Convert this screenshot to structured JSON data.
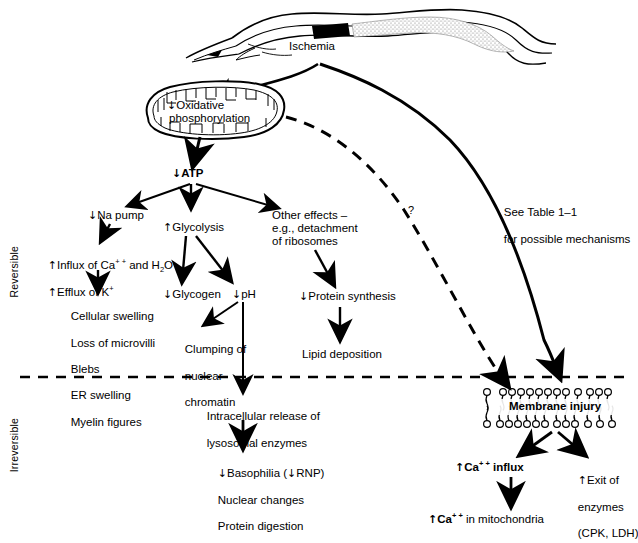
{
  "figure": {
    "zones": {
      "reversible": "Reversible",
      "irreversible": "Irreversible"
    },
    "divider": "dashed-reversibility-line"
  },
  "nodes": {
    "ischemia": {
      "label": "Ischemia"
    },
    "oxphos": {
      "arrow": "↓",
      "line1": "Oxidative",
      "line2": "phosphorylation"
    },
    "atp": {
      "arrow": "↓",
      "label": "ATP"
    },
    "na_pump": {
      "arrow": "↓",
      "label": "Na pump"
    },
    "glycolysis": {
      "arrow": "↑",
      "label": "Glycolysis"
    },
    "other_effects": {
      "line1": "Other effects –",
      "line2": "e.g., detachment",
      "line3": "of ribosomes"
    },
    "influx": {
      "line1_arrow": "↑",
      "line1_a": "Influx of Ca",
      "line1_sup": "+ +",
      "line1_b": " and H",
      "line1_sub": "2",
      "line1_c": "O",
      "line2_arrow": "↑",
      "line2_a": "Efflux of K",
      "line2_sup": "+"
    },
    "cell_changes": {
      "items": [
        "Cellular swelling",
        "Loss of microvilli",
        "Blebs",
        "ER swelling",
        "Myelin figures"
      ]
    },
    "glycogen": {
      "arrow": "↓",
      "label": "Glycogen"
    },
    "ph": {
      "arrow": "↓",
      "label": "pH"
    },
    "clumping": {
      "line1": "Clumping of",
      "line2": "nuclear",
      "line3": "chromatin"
    },
    "protein_synthesis": {
      "arrow": "↓",
      "label": "Protein synthesis"
    },
    "lipid_deposition": {
      "label": "Lipid deposition"
    },
    "see_table": {
      "line1": "See Table 1–1",
      "line2": "for possible mechanisms"
    },
    "question_mark": {
      "label": "?"
    },
    "lysosomal": {
      "line1": "Intracellular release of",
      "line2": "lysosomal enzymes"
    },
    "basophilia": {
      "line1_arrow": "↓",
      "line1_a": "Basophilia (",
      "line1_arrow2": "↓",
      "line1_b": "RNP)",
      "line2": "Nuclear changes",
      "line3": "Protein digestion"
    },
    "membrane_injury": {
      "label": "Membrane injury"
    },
    "ca_influx": {
      "arrow": "↑",
      "a": "Ca",
      "sup": "+ +",
      "b": " influx"
    },
    "exit_enzymes": {
      "line1_arrow": "↑",
      "line1": "Exit of",
      "line2": "enzymes",
      "line3": "(CPK, LDH)"
    },
    "ca_mito": {
      "arrow": "↑",
      "a": "Ca",
      "sup": "+ +",
      "b": " in mitochondria"
    }
  },
  "colors": {
    "ink": "#000000",
    "background": "#ffffff",
    "stipple": "#9a9a9a"
  }
}
